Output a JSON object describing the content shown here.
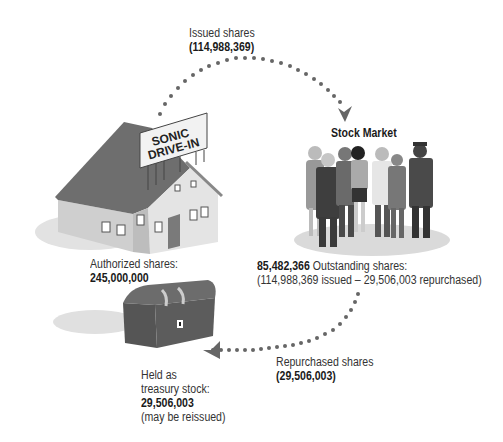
{
  "diagram": {
    "issued": {
      "label": "Issued shares",
      "value": "(114,988,369)"
    },
    "stock_market": {
      "title": "Stock Market"
    },
    "sign": {
      "line1": "SONIC",
      "line2": "DRIVE-IN"
    },
    "authorized": {
      "label": "Authorized shares:",
      "value": "245,000,000"
    },
    "outstanding": {
      "value": "85,482,366",
      "label": " Outstanding shares:",
      "detail": "(114,988,369 issued – 29,506,003 repurchased)"
    },
    "repurchased": {
      "label": "Repurchased shares",
      "value": "(29,506,003)"
    },
    "treasury": {
      "line1": "Held as",
      "line2": "treasury stock:",
      "value": "29,506,003",
      "note": "(may be reissued)"
    },
    "colors": {
      "roof": "#6b6b6b",
      "wall": "#dcdcdc",
      "chest": "#5e5e5e",
      "dots": "#666666",
      "shadow": "#d6d6d6"
    }
  }
}
